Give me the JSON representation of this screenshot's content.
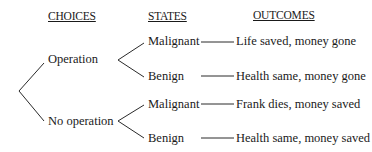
{
  "headers": {
    "choices": "CHOICES",
    "states": "STATES",
    "outcomes": "OUTCOMES"
  },
  "choices": [
    {
      "label": "Operation",
      "states": [
        {
          "label": "Malignant",
          "outcome": "Life saved, money gone"
        },
        {
          "label": "Benign",
          "outcome": "Health same, money gone"
        }
      ]
    },
    {
      "label": "No operation",
      "states": [
        {
          "label": "Malignant",
          "outcome": "Frank dies, money saved"
        },
        {
          "label": "Benign",
          "outcome": "Health same, money saved"
        }
      ]
    }
  ]
}
